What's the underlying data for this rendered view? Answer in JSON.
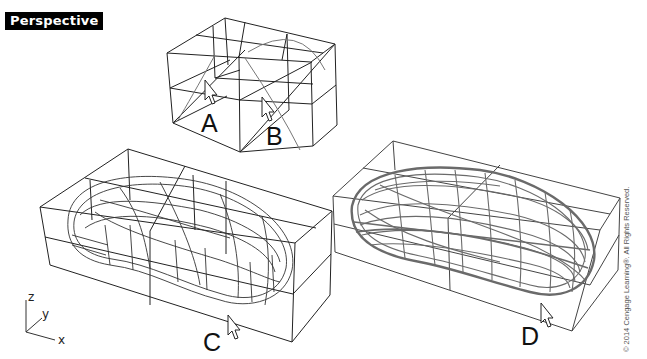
{
  "viewport": {
    "title": "Perspective"
  },
  "models": [
    {
      "id": "A",
      "label": "A",
      "description": "empty bounding box grid with cursor"
    },
    {
      "id": "B",
      "label": "B",
      "description": "bounding box grid with curve and cursor"
    },
    {
      "id": "C",
      "label": "C",
      "description": "mouse-shape wireframe in bounding box with cursor"
    },
    {
      "id": "D",
      "label": "D",
      "description": "dense mouse-shape wireframe in bounding box with cursor"
    }
  ],
  "axes": {
    "z": "z",
    "y": "y",
    "x": "x"
  },
  "copyright": "© 2014 Cengage Learning®. All Rights Reserved.",
  "colors": {
    "background": "#ffffff",
    "wire": "#222222",
    "dense_wire": "#6a6a6a",
    "title_bg": "#000000",
    "title_fg": "#ffffff"
  }
}
